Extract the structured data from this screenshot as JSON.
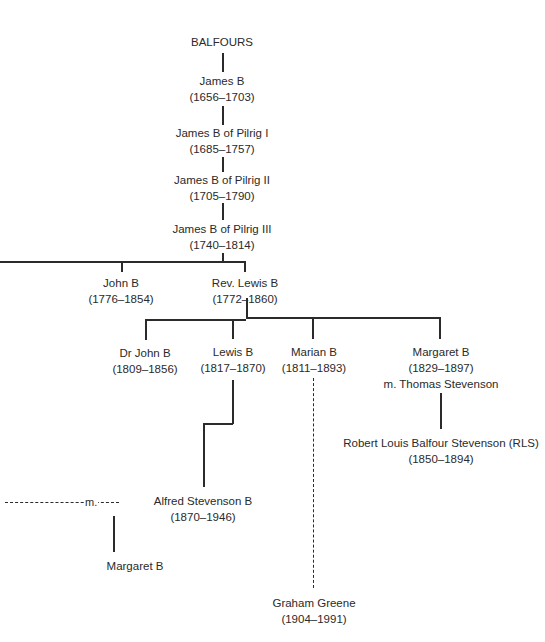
{
  "diagram": {
    "type": "family-tree",
    "root": "BALFOURS",
    "nodes": {
      "balfours": {
        "name": "BALFOURS"
      },
      "james_b": {
        "name": "James B",
        "dates": "(1656–1703)"
      },
      "pilrig_1": {
        "name": "James B of Pilrig I",
        "dates": "(1685–1757)"
      },
      "pilrig_2": {
        "name": "James B of Pilrig II",
        "dates": "(1705–1790)"
      },
      "pilrig_3": {
        "name": "James B of Pilrig III",
        "dates": "(1740–1814)"
      },
      "john_b": {
        "name": "John B",
        "dates": "(1776–1854)"
      },
      "rev_lewis": {
        "name": "Rev. Lewis B",
        "dates": "(1772–1860)"
      },
      "dr_john": {
        "name": "Dr John B",
        "dates": "(1809–1856)"
      },
      "lewis_b": {
        "name": "Lewis B",
        "dates": "(1817–1870)"
      },
      "marian_b": {
        "name": "Marian B",
        "dates": "(1811–1893)"
      },
      "margaret_b": {
        "name": "Margaret B",
        "dates": "(1829–1897)",
        "spouse": "m. Thomas Stevenson"
      },
      "rls": {
        "name": "Robert Louis Balfour Stevenson (RLS)",
        "dates": "(1850–1894)"
      },
      "alfred": {
        "name": "Alfred Stevenson B",
        "dates": "(1870–1946)"
      },
      "graham_greene": {
        "name": "Graham Greene",
        "dates": "(1904–1991)"
      },
      "margaret_b2": {
        "name": "Margaret B"
      }
    },
    "marriage_label": "m.",
    "edges": [
      [
        "balfours",
        "james_b"
      ],
      [
        "james_b",
        "pilrig_1"
      ],
      [
        "pilrig_1",
        "pilrig_2"
      ],
      [
        "pilrig_2",
        "pilrig_3"
      ],
      [
        "pilrig_3",
        "john_b"
      ],
      [
        "pilrig_3",
        "rev_lewis"
      ],
      [
        "rev_lewis",
        "dr_john"
      ],
      [
        "rev_lewis",
        "lewis_b"
      ],
      [
        "rev_lewis",
        "marian_b"
      ],
      [
        "rev_lewis",
        "margaret_b"
      ],
      [
        "margaret_b",
        "rls"
      ],
      [
        "lewis_b",
        "alfred"
      ],
      [
        "marian_b",
        "graham_greene",
        "dashed"
      ],
      [
        "marriage",
        "margaret_b2"
      ]
    ]
  }
}
